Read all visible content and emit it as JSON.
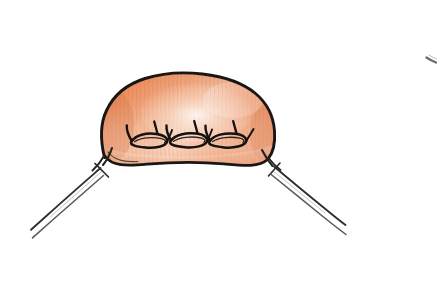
{
  "image": {
    "kind": "hand-drawn-medical-illustration",
    "subject": "sutured tissue mound with suture threads",
    "width": 445,
    "height": 307,
    "background_color": "#ffffff",
    "has_text": false,
    "has_border": false,
    "medium": "ink pen outline with colored pencil shading"
  },
  "palette": {
    "background": "#ffffff",
    "ink_outline": "#1a1613",
    "ink_thread": "#2b2b2b",
    "ink_thread_light": "#55565a",
    "tissue_mid": "#e8845a",
    "tissue_deep": "#d9seven",
    "tissue_dark": "#d4703f",
    "tissue_light": "#f4bfa2",
    "tissue_pale": "#fae5d8",
    "tissue_highlight": "#fdf4ee",
    "hatch_stroke": "#dd7b4d",
    "stray_mark": "#3a3a3a"
  },
  "elements": {
    "tissue_mound": {
      "name": "tissue mound",
      "description": "Rounded dome of tissue, flat-ish curved base, filled with salmon-orange pencil hatching and a pale highlight in the upper center.",
      "bounds": {
        "x": 99,
        "y": 73,
        "width": 178,
        "height": 95
      }
    },
    "suture_loops": {
      "name": "suture stitch loops",
      "count": 3,
      "description": "Three elongated oval suture loops lying along the lower portion of the mound, each with two angled thread tails rising to the upper right.",
      "centers": [
        {
          "x": 148,
          "y": 141
        },
        {
          "x": 187,
          "y": 139
        },
        {
          "x": 226,
          "y": 139
        }
      ]
    },
    "thread_left": {
      "name": "left suture thread pair",
      "description": "Two long thin threads leaving the lower-left edge of the mound, crossing once near the tissue, running diagonally down-left.",
      "start": {
        "x": 112,
        "y": 150
      },
      "end": {
        "x": 32,
        "y": 241
      }
    },
    "thread_right": {
      "name": "right suture thread pair",
      "description": "Two long thin threads leaving the lower-right edge of the mound, crossing once near the tissue, running diagonally down-right.",
      "start": {
        "x": 262,
        "y": 150
      },
      "end": {
        "x": 352,
        "y": 236
      }
    },
    "stray_mark": {
      "name": "stray pen mark",
      "description": "Small faint smudge of ink in the upper right area of the page.",
      "position": {
        "x": 432,
        "y": 60
      }
    }
  }
}
